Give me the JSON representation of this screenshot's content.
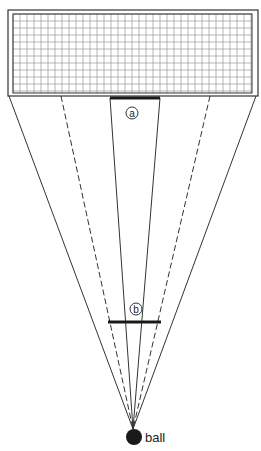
{
  "diagram": {
    "colors": {
      "line": "#333333",
      "grid": "#9a9a9a",
      "ball": "#1a1a1a",
      "background": "#ffffff"
    },
    "goal": {
      "outer": {
        "x": 8,
        "y": 10,
        "w": 250,
        "h": 86
      },
      "inner": {
        "x": 13,
        "y": 14,
        "w": 239,
        "h": 79
      },
      "grid_cell": 7
    },
    "ball": {
      "cx": 134,
      "cy": 437,
      "r": 8,
      "label": "ball"
    },
    "apex": {
      "x": 133,
      "y": 429
    },
    "lines": {
      "outer_left": {
        "x": 9,
        "y": 96
      },
      "outer_right": {
        "x": 256,
        "y": 96
      },
      "dashed_left": {
        "x": 61,
        "y": 96
      },
      "dashed_right": {
        "x": 210,
        "y": 96
      },
      "inner_left": {
        "x": 110,
        "y": 98
      },
      "inner_right": {
        "x": 160,
        "y": 98
      }
    },
    "markers": [
      {
        "id": "a",
        "label": "a",
        "bar": {
          "x1": 110,
          "x2": 160,
          "y": 98
        },
        "circle": {
          "cx": 132,
          "cy": 113,
          "r": 6
        }
      },
      {
        "id": "b",
        "label": "b",
        "bar": {
          "x1": 108,
          "x2": 161,
          "y": 322
        },
        "circle": {
          "cx": 136,
          "cy": 309,
          "r": 6
        }
      }
    ]
  }
}
